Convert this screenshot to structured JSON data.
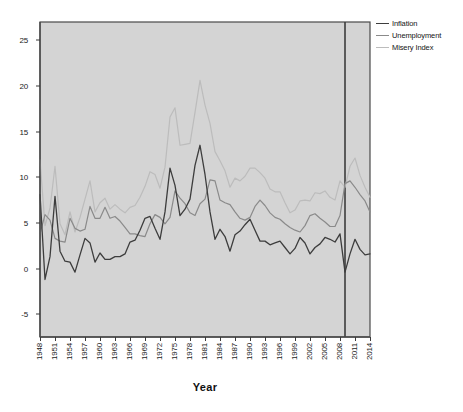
{
  "chart_data": {
    "type": "line",
    "title": "",
    "xlabel": "Year",
    "ylabel": "",
    "grid": false,
    "legend_position": "right",
    "ylim": [
      -7.5,
      27
    ],
    "yticks": [
      25,
      20,
      15,
      10,
      5,
      0,
      -5
    ],
    "xlim": [
      1948,
      2014
    ],
    "xticks": [
      1948,
      1951,
      1954,
      1957,
      1960,
      1963,
      1966,
      1969,
      1972,
      1975,
      1978,
      1981,
      1984,
      1987,
      1990,
      1993,
      1996,
      1999,
      2002,
      2005,
      2008,
      2011,
      2014
    ],
    "annotations": [
      {
        "type": "reference-line",
        "orientation": "vertical",
        "x": 2009,
        "color": "#3d3d3d"
      }
    ],
    "x": [
      1948,
      1949,
      1950,
      1951,
      1952,
      1953,
      1954,
      1955,
      1956,
      1957,
      1958,
      1959,
      1960,
      1961,
      1962,
      1963,
      1964,
      1965,
      1966,
      1967,
      1968,
      1969,
      1970,
      1971,
      1972,
      1973,
      1974,
      1975,
      1976,
      1977,
      1978,
      1979,
      1980,
      1981,
      1982,
      1983,
      1984,
      1985,
      1986,
      1987,
      1988,
      1989,
      1990,
      1991,
      1992,
      1993,
      1994,
      1995,
      1996,
      1997,
      1998,
      1999,
      2000,
      2001,
      2002,
      2003,
      2004,
      2005,
      2006,
      2007,
      2008,
      2009,
      2010,
      2011,
      2012,
      2013,
      2014
    ],
    "series": [
      {
        "name": "Inflation",
        "color": "#3d3d3d",
        "values": [
          8.1,
          -1.2,
          1.3,
          7.9,
          1.9,
          0.8,
          0.7,
          -0.4,
          1.5,
          3.3,
          2.8,
          0.7,
          1.7,
          1.0,
          1.0,
          1.3,
          1.3,
          1.6,
          2.9,
          3.1,
          4.2,
          5.5,
          5.7,
          4.4,
          3.2,
          6.2,
          11.0,
          9.1,
          5.8,
          6.5,
          7.6,
          11.3,
          13.5,
          10.3,
          6.2,
          3.2,
          4.3,
          3.5,
          1.9,
          3.7,
          4.1,
          4.8,
          5.4,
          4.2,
          3.0,
          3.0,
          2.6,
          2.8,
          3.0,
          2.3,
          1.6,
          2.2,
          3.4,
          2.8,
          1.6,
          2.3,
          2.7,
          3.4,
          3.2,
          2.9,
          3.8,
          -0.4,
          1.6,
          3.2,
          2.1,
          1.5,
          1.6
        ]
      },
      {
        "name": "Unemployment",
        "color": "#8a8a8a",
        "values": [
          3.8,
          5.9,
          5.3,
          3.3,
          3.0,
          2.9,
          5.5,
          4.4,
          4.1,
          4.3,
          6.8,
          5.5,
          5.5,
          6.7,
          5.5,
          5.7,
          5.2,
          4.5,
          3.8,
          3.8,
          3.6,
          3.5,
          4.9,
          5.9,
          5.6,
          4.9,
          5.6,
          8.5,
          7.7,
          7.1,
          6.1,
          5.8,
          7.1,
          7.6,
          9.7,
          9.6,
          7.5,
          7.2,
          7.0,
          6.2,
          5.5,
          5.3,
          5.6,
          6.8,
          7.5,
          6.9,
          6.1,
          5.6,
          5.4,
          4.9,
          4.5,
          4.2,
          4.0,
          4.7,
          5.8,
          6.0,
          5.5,
          5.1,
          4.6,
          4.6,
          5.8,
          9.3,
          9.6,
          8.9,
          8.1,
          7.4,
          6.2
        ]
      },
      {
        "name": "Misery Index",
        "color": "#bcbcbc",
        "values": [
          11.9,
          4.7,
          6.6,
          11.2,
          4.9,
          3.7,
          6.2,
          4.0,
          5.6,
          7.6,
          9.6,
          6.2,
          7.2,
          7.7,
          6.5,
          7.0,
          6.5,
          6.1,
          6.7,
          6.9,
          7.8,
          9.0,
          10.6,
          10.3,
          8.8,
          11.1,
          16.6,
          17.6,
          13.5,
          13.6,
          13.7,
          17.1,
          20.6,
          17.9,
          15.9,
          12.8,
          11.8,
          10.7,
          8.9,
          9.9,
          9.6,
          10.1,
          11.0,
          11.0,
          10.5,
          9.9,
          8.7,
          8.4,
          8.4,
          7.2,
          6.1,
          6.4,
          7.4,
          7.5,
          7.4,
          8.3,
          8.2,
          8.5,
          7.8,
          7.5,
          9.6,
          8.9,
          11.2,
          12.1,
          10.2,
          8.9,
          7.8
        ]
      }
    ]
  },
  "legend": {
    "items": [
      {
        "label": "Inflation"
      },
      {
        "label": "Unemployment"
      },
      {
        "label": "Misery Index"
      }
    ]
  },
  "axis": {
    "x_title": "Year"
  }
}
